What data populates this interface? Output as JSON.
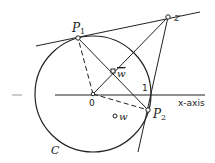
{
  "diagram": {
    "points": {
      "P1": {
        "label": "P",
        "sub": "1"
      },
      "P2": {
        "label": "P",
        "sub": "2"
      },
      "z": {
        "label": "z"
      },
      "wbar": {
        "label": "w"
      },
      "w": {
        "label": "w"
      },
      "origin": {
        "label": "0"
      },
      "one": {
        "label": "1"
      }
    },
    "circle_label": "C",
    "axis_label": "x-axis",
    "colors": {
      "line": "#222222",
      "background": "#ffffff"
    }
  }
}
